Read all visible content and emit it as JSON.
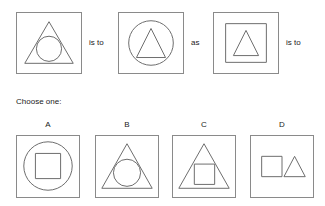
{
  "puzzle": {
    "type": "visual-analogy-multiple-choice",
    "prompt_label": "Choose one:",
    "connectors": [
      {
        "text": "is to"
      },
      {
        "text": "as"
      },
      {
        "text": "is to"
      }
    ],
    "sequence": [
      {
        "id": "panel-1",
        "description": "square containing a triangle containing a circle",
        "shapes": [
          "square",
          "triangle",
          "circle"
        ]
      },
      {
        "id": "panel-2",
        "description": "square containing a circle containing a triangle",
        "shapes": [
          "square",
          "circle",
          "triangle"
        ]
      },
      {
        "id": "panel-3",
        "description": "square containing a square containing a triangle",
        "shapes": [
          "square",
          "square",
          "triangle"
        ]
      }
    ],
    "options": [
      {
        "id": "option-a",
        "label": "A",
        "description": "square containing a circle containing a square",
        "shapes": [
          "square",
          "circle",
          "square"
        ]
      },
      {
        "id": "option-b",
        "label": "B",
        "description": "square containing a triangle containing a circle",
        "shapes": [
          "square",
          "triangle",
          "circle"
        ]
      },
      {
        "id": "option-c",
        "label": "C",
        "description": "square containing a triangle containing a square",
        "shapes": [
          "square",
          "triangle",
          "square"
        ]
      },
      {
        "id": "option-d",
        "label": "D",
        "description": "square containing a square beside a triangle",
        "shapes": [
          "square",
          "square",
          "triangle"
        ]
      }
    ]
  },
  "colors": {
    "background": "#ffffff",
    "panel_border": "#8a8a8a",
    "shape_stroke": "#6e6e6e",
    "text": "#1a1a1a"
  }
}
